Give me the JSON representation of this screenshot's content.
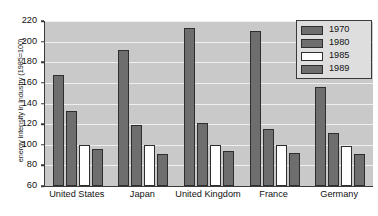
{
  "chart_data": {
    "type": "bar",
    "title": "",
    "subtitle": "",
    "xlabel": "",
    "ylabel": "energy intensity in industry (1985=100)",
    "categories": [
      "United States",
      "Japan",
      "United Kingdom",
      "France",
      "Germany"
    ],
    "series": [
      {
        "name": "1970",
        "color": "#6e6e6e",
        "values": [
          168,
          192,
          213,
          210,
          156
        ]
      },
      {
        "name": "1980",
        "color": "#6e6e6e",
        "values": [
          133,
          119,
          121,
          115,
          111
        ]
      },
      {
        "name": "1985",
        "color": "#ffffff",
        "values": [
          100,
          100,
          100,
          100,
          99
        ]
      },
      {
        "name": "1989",
        "color": "#6e6e6e",
        "values": [
          96,
          91,
          94,
          92,
          91
        ]
      }
    ],
    "ylim": [
      60,
      220
    ],
    "yticks": [
      60,
      80,
      100,
      120,
      140,
      160,
      180,
      200,
      220
    ],
    "ytick_labels": [
      "60",
      "80",
      "100",
      "120",
      "140",
      "160",
      "180",
      "200",
      "220"
    ],
    "grid": true,
    "grid_color": "#efefef",
    "legend_position": "top-right",
    "plot_background": "#c9c9c9",
    "bar_edge_color": "#2e2e2e",
    "axis_color": "#3a3a3a"
  }
}
